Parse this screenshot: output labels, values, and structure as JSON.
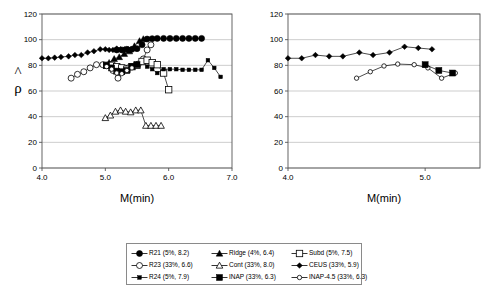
{
  "figure": {
    "ylabel": "ρ",
    "yhat_accent": "^",
    "xlabel": "M(min)"
  },
  "legend": {
    "entries": [
      {
        "key": "R21",
        "label": "R21 (5%, 8.2)",
        "marker": "filled-circle",
        "marker_name": "filled-circle-marker-icon"
      },
      {
        "key": "Ridge",
        "label": "Ridge (4%, 6.4)",
        "marker": "filled-triangle",
        "marker_name": "filled-triangle-marker-icon"
      },
      {
        "key": "Subd",
        "label": "Subd (5%, 7.5)",
        "marker": "open-square",
        "marker_name": "open-square-marker-icon"
      },
      {
        "key": "R23",
        "label": "R23 (33%, 6.6)",
        "marker": "open-circle",
        "marker_name": "open-circle-marker-icon"
      },
      {
        "key": "Cont",
        "label": "Cont (33%, 8.0)",
        "marker": "open-triangle",
        "marker_name": "open-triangle-marker-icon"
      },
      {
        "key": "CEUS",
        "label": "CEUS (33%, 5.9)",
        "marker": "filled-diamond",
        "marker_name": "filled-diamond-marker-icon"
      },
      {
        "key": "R24",
        "label": "R24 (5%, 7.9)",
        "marker": "small-filled-square",
        "marker_name": "small-filled-square-marker-icon"
      },
      {
        "key": "INAP",
        "label": "INAP (33%, 6.3)",
        "marker": "filled-square",
        "marker_name": "filled-square-marker-icon"
      },
      {
        "key": "INAP-4.5",
        "label": "INAP-4.5 (33%, 6.3)",
        "marker": "open-circle-small",
        "marker_name": "open-circle-small-marker-icon"
      }
    ]
  },
  "chart_data": [
    {
      "id": "left-panel",
      "type": "line",
      "title": "",
      "xlabel": "M(min)",
      "ylabel": "ρ̂",
      "xlim": [
        4.0,
        7.0
      ],
      "ylim": [
        0,
        120
      ],
      "xticks": [
        "4.0",
        "5.0",
        "6.0",
        "7.0"
      ],
      "yticks": [
        "0",
        "20",
        "40",
        "60",
        "80",
        "100",
        "120"
      ],
      "grid": true,
      "legend_position": "below-figure",
      "series": [
        {
          "name": "CEUS",
          "marker": "filled-diamond",
          "x": [
            4.0,
            4.1,
            4.2,
            4.3,
            4.42,
            4.52,
            4.62,
            4.72,
            4.82,
            4.92,
            5.0,
            5.06,
            5.12,
            5.18,
            5.24,
            5.3,
            5.36,
            5.42
          ],
          "y": [
            85.5,
            85.5,
            86.0,
            86.5,
            87.0,
            88.0,
            88.0,
            90.0,
            91.0,
            92.5,
            92.5,
            92.0,
            92.0,
            93.0,
            92.5,
            92.5,
            92.5,
            92.5
          ]
        },
        {
          "name": "R21",
          "marker": "filled-circle",
          "x": [
            5.18,
            5.26,
            5.34,
            5.42,
            5.5,
            5.58,
            5.66,
            5.74,
            5.82,
            5.92,
            6.02,
            6.12,
            6.22,
            6.32,
            6.42,
            6.52
          ],
          "y": [
            92.0,
            92.0,
            92.5,
            92.5,
            93.0,
            96.0,
            100.5,
            100.8,
            101.0,
            101.0,
            101.0,
            101.0,
            101.0,
            101.0,
            101.0,
            101.0
          ]
        },
        {
          "name": "Ridge",
          "marker": "filled-triangle",
          "x": [
            5.06,
            5.14,
            5.22,
            5.3,
            5.38,
            5.46,
            5.54,
            5.6
          ],
          "y": [
            82.0,
            85.0,
            86.5,
            89.0,
            91.0,
            95.0,
            99.0,
            100.5
          ]
        },
        {
          "name": "R23",
          "marker": "open-circle",
          "x": [
            4.46,
            4.56,
            4.66,
            4.76,
            4.86,
            4.96,
            5.04,
            5.12,
            5.2,
            5.28,
            5.36,
            5.44,
            5.52,
            5.6,
            5.66,
            5.72
          ],
          "y": [
            70.0,
            73.0,
            75.0,
            78.0,
            80.5,
            80.5,
            80.0,
            76.0,
            70.0,
            76.5,
            78.0,
            79.0,
            81.0,
            85.0,
            92.0,
            96.0
          ]
        },
        {
          "name": "Subd",
          "marker": "open-square",
          "x": [
            5.02,
            5.1,
            5.18,
            5.26,
            5.34,
            5.42,
            5.5,
            5.58,
            5.66,
            5.74,
            5.82,
            5.92,
            6.0
          ],
          "y": [
            80.0,
            80.0,
            79.0,
            78.0,
            77.0,
            79.0,
            80.0,
            83.0,
            84.0,
            82.0,
            80.5,
            74.0,
            61.0
          ]
        },
        {
          "name": "INAP",
          "marker": "filled-square",
          "x": [
            5.02,
            5.1,
            5.18,
            5.26,
            5.34,
            5.42,
            5.5
          ],
          "y": [
            80.0,
            78.0,
            75.5,
            75.0,
            76.0,
            79.0,
            80.5
          ]
        },
        {
          "name": "INAP-4.5",
          "marker": "open-circle-small",
          "x": [
            5.02,
            5.1,
            5.18,
            5.26,
            5.34,
            5.42
          ],
          "y": [
            79.0,
            77.0,
            74.0,
            73.5,
            76.0,
            78.0
          ]
        },
        {
          "name": "R24",
          "marker": "small-filled-square",
          "x": [
            5.66,
            5.74,
            5.82,
            5.92,
            6.02,
            6.12,
            6.22,
            6.32,
            6.42,
            6.52,
            6.62,
            6.72,
            6.82
          ],
          "y": [
            79.0,
            77.0,
            74.0,
            77.0,
            77.0,
            77.0,
            76.5,
            76.5,
            76.5,
            76.5,
            84.0,
            78.0,
            71.0
          ]
        },
        {
          "name": "Cont",
          "marker": "open-triangle",
          "x": [
            5.0,
            5.08,
            5.16,
            5.24,
            5.32,
            5.4,
            5.48,
            5.56,
            5.64,
            5.72,
            5.8,
            5.88
          ],
          "y": [
            39.0,
            41.0,
            44.0,
            45.0,
            44.0,
            43.5,
            45.0,
            45.0,
            33.0,
            33.0,
            33.0,
            33.0
          ]
        }
      ]
    },
    {
      "id": "right-panel",
      "type": "line",
      "title": "",
      "xlabel": "M(min)",
      "ylabel": "",
      "xlim": [
        4.0,
        5.4
      ],
      "ylim": [
        0,
        120
      ],
      "xticks": [
        "4.0",
        "5.0"
      ],
      "yticks": [
        "0",
        "20",
        "40",
        "60",
        "80",
        "100",
        "120"
      ],
      "grid": true,
      "legend_position": "below-figure",
      "series": [
        {
          "name": "CEUS",
          "marker": "filled-diamond",
          "x": [
            4.0,
            4.1,
            4.2,
            4.3,
            4.4,
            4.52,
            4.62,
            4.74,
            4.85,
            4.95,
            5.05
          ],
          "y": [
            85.5,
            85.5,
            88.0,
            87.0,
            87.0,
            90.0,
            88.0,
            90.0,
            94.5,
            93.5,
            92.5
          ]
        },
        {
          "name": "INAP-4.5",
          "marker": "open-circle-small",
          "x": [
            4.5,
            4.6,
            4.7,
            4.8,
            4.92,
            5.02,
            5.12,
            5.22
          ],
          "y": [
            70.0,
            75.0,
            79.5,
            81.0,
            80.5,
            78.0,
            70.0,
            74.0
          ]
        },
        {
          "name": "INAP",
          "marker": "filled-square",
          "x": [
            5.0,
            5.1,
            5.2
          ],
          "y": [
            80.5,
            76.0,
            74.0
          ]
        }
      ]
    }
  ]
}
